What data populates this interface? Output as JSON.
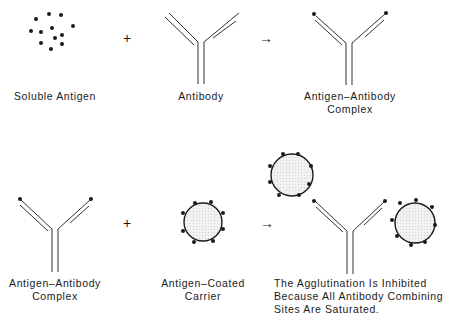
{
  "colors": {
    "ink": "#1a1a1a",
    "carrier_fill": "#e8e8e8"
  },
  "row1": {
    "soluble_antigen": {
      "label": "Soluble Antigen"
    },
    "plus": "+",
    "antibody": {
      "label": "Antibody"
    },
    "arrow": "→",
    "complex": {
      "label_line1": "Antigen–Antibody",
      "label_line2": "Complex"
    }
  },
  "row2": {
    "complex": {
      "label_line1": "Antigen–Antibody",
      "label_line2": "Complex"
    },
    "plus": "+",
    "carrier": {
      "label_line1": "Antigen–Coated",
      "label_line2": "Carrier"
    },
    "arrow": "→",
    "result": {
      "line1": "The Agglutination Is Inhibited",
      "line2": "Because All Antibody Combining",
      "line3": "Sites Are Saturated."
    }
  }
}
